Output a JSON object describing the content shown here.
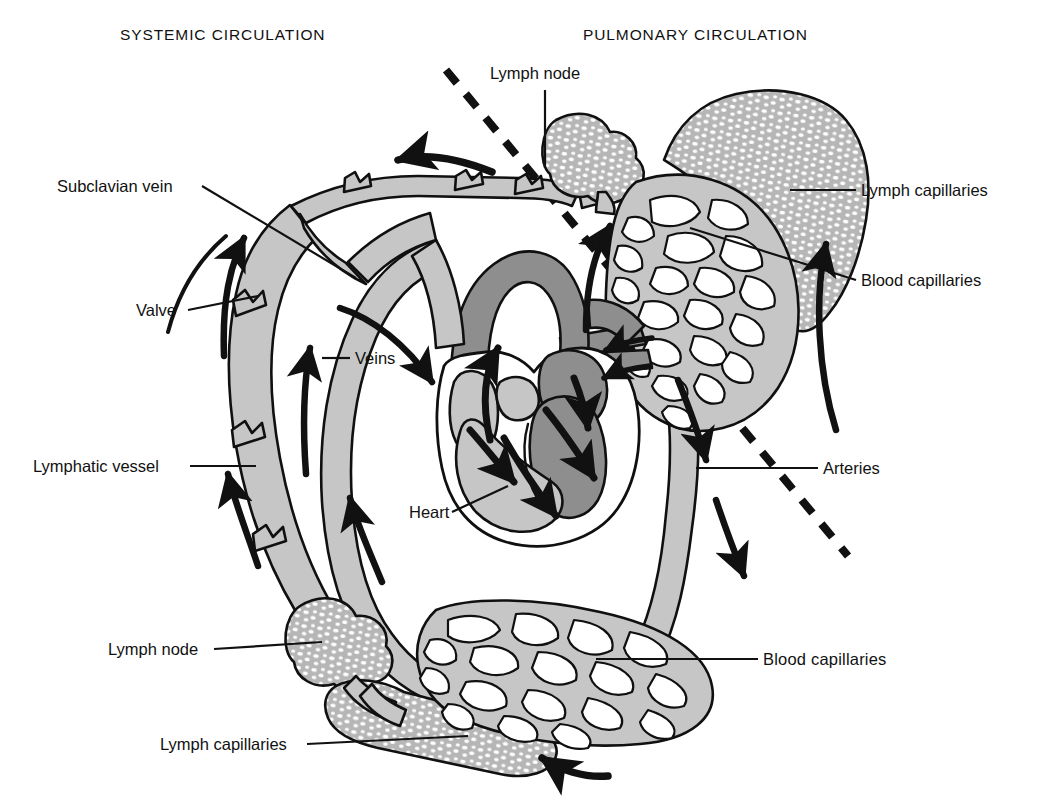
{
  "figure": {
    "title_left": "SYSTEMIC CIRCULATION",
    "title_right": "PULMONARY CIRCULATION",
    "background": "#ffffff",
    "ink": "#111111"
  },
  "palette": {
    "vessel_light": "#c6c6c6",
    "vessel_dark": "#8e8e8e",
    "lymph_fill": "#b8b8b8",
    "outline": "#101010",
    "white": "#ffffff"
  },
  "headers": [
    {
      "id": "systemic",
      "text": "SYSTEMIC CIRCULATION",
      "x": 120,
      "y": 40
    },
    {
      "id": "pulmonary",
      "text": "PULMONARY CIRCULATION",
      "x": 583,
      "y": 40
    }
  ],
  "labels": [
    {
      "id": "lymph-node-top",
      "text": "Lymph node",
      "x": 490,
      "y": 79,
      "anchor": "start"
    },
    {
      "id": "lymph-capillaries-r",
      "text": "Lymph capillaries",
      "x": 861,
      "y": 196,
      "anchor": "start"
    },
    {
      "id": "blood-capillaries-r",
      "text": "Blood capillaries",
      "x": 861,
      "y": 286,
      "anchor": "start"
    },
    {
      "id": "arteries",
      "text": "Arteries",
      "x": 823,
      "y": 474,
      "anchor": "start"
    },
    {
      "id": "blood-capillaries-b",
      "text": "Blood  capillaries",
      "x": 763,
      "y": 665,
      "anchor": "start"
    },
    {
      "id": "subclavian-vein",
      "text": "Subclavian vein",
      "x": 57,
      "y": 192,
      "anchor": "start"
    },
    {
      "id": "valve",
      "text": "Valve",
      "x": 136,
      "y": 316,
      "anchor": "start"
    },
    {
      "id": "veins",
      "text": "Veins",
      "x": 355,
      "y": 364,
      "anchor": "start"
    },
    {
      "id": "lymphatic-vessel",
      "text": "Lymphatic vessel",
      "x": 33,
      "y": 472,
      "anchor": "start"
    },
    {
      "id": "heart",
      "text": "Heart",
      "x": 409,
      "y": 518,
      "anchor": "start"
    },
    {
      "id": "lymph-node-bottom",
      "text": "Lymph node",
      "x": 108,
      "y": 655,
      "anchor": "start"
    },
    {
      "id": "lymph-capillaries-b",
      "text": "Lymph capillaries",
      "x": 160,
      "y": 750,
      "anchor": "start"
    }
  ],
  "divider": {
    "id": "systemic-pulmonary-divider",
    "style": "dashed",
    "from": {
      "x": 446,
      "y": 70
    },
    "to": {
      "x": 848,
      "y": 556
    }
  },
  "structures": [
    {
      "id": "heart",
      "kind": "organ",
      "tone": "mixed"
    },
    {
      "id": "aortic-arch",
      "kind": "artery",
      "tone": "dark"
    },
    {
      "id": "pulmonary-trunk",
      "kind": "artery",
      "tone": "dark"
    },
    {
      "id": "vena-cava",
      "kind": "vein",
      "tone": "light"
    },
    {
      "id": "systemic-veins",
      "kind": "vein",
      "tone": "light"
    },
    {
      "id": "systemic-arteries",
      "kind": "artery",
      "tone": "light"
    },
    {
      "id": "lymphatic-duct",
      "kind": "lymph",
      "tone": "light"
    },
    {
      "id": "lymph-node-upper",
      "kind": "node",
      "tone": "stipple"
    },
    {
      "id": "lymph-node-lower",
      "kind": "node",
      "tone": "stipple"
    },
    {
      "id": "lymph-capillary-bed-upper",
      "kind": "lymph-bed",
      "tone": "stipple"
    },
    {
      "id": "lymph-capillary-bed-lower",
      "kind": "lymph-bed",
      "tone": "stipple"
    },
    {
      "id": "blood-capillary-bed-upper",
      "kind": "capillary-net",
      "tone": "light"
    },
    {
      "id": "blood-capillary-bed-lower",
      "kind": "capillary-net",
      "tone": "light"
    }
  ],
  "flow_arrows": [
    {
      "id": "arrow-subclavian-top",
      "direction": "left"
    },
    {
      "id": "arrow-lymph-ascend-upper",
      "direction": "up"
    },
    {
      "id": "arrow-lymph-ascend-lower",
      "direction": "up"
    },
    {
      "id": "arrow-vein-ascend",
      "direction": "up"
    },
    {
      "id": "arrow-vein-return",
      "direction": "up"
    },
    {
      "id": "arrow-into-right-atrium",
      "direction": "down-right"
    },
    {
      "id": "arrow-aorta-up",
      "direction": "up"
    },
    {
      "id": "arrow-pulmonary-to-lung",
      "direction": "up"
    },
    {
      "id": "arrow-lung-capillary-flow",
      "direction": "up"
    },
    {
      "id": "arrow-artery-descend-upper",
      "direction": "down"
    },
    {
      "id": "arrow-artery-descend-lower",
      "direction": "down"
    },
    {
      "id": "arrow-capillary-inflow",
      "direction": "left"
    },
    {
      "id": "arrow-heart-ra",
      "direction": "down-right"
    },
    {
      "id": "arrow-heart-rv",
      "direction": "down-right"
    },
    {
      "id": "arrow-heart-la",
      "direction": "down-left"
    },
    {
      "id": "arrow-heart-lv",
      "direction": "up-right"
    },
    {
      "id": "arrow-pulmonary-veins-in",
      "direction": "left"
    }
  ]
}
